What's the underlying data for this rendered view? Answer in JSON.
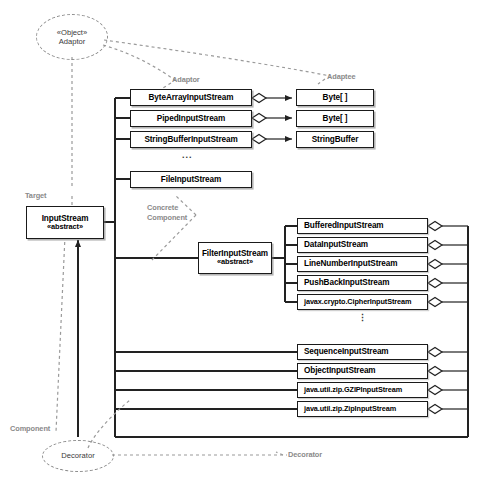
{
  "diagram": {
    "pattern_labels": {
      "object_adaptor_line1": "«Object»",
      "object_adaptor_line2": "Adaptor",
      "decorator_ellipse": "Decorator",
      "adaptor": "Adaptor",
      "adaptee": "Adaptee",
      "target": "Target",
      "component": "Component",
      "decorator_right": "Decorator",
      "concrete_component_line1": "Concrete",
      "concrete_component_line2": "Component"
    },
    "ellipsis_horizontal": "...",
    "ellipsis_vertical": "⋮",
    "colors": {
      "box_border": "#1a1a1a",
      "box_fill": "#ffffff",
      "line": "#222222",
      "dashed_annotation": "#9a9a9a",
      "label_text": "#8a8a8a"
    },
    "target_class": {
      "name": "InputStream",
      "stereotype": "«abstract»"
    },
    "decorator_class": {
      "name": "FilterInputStream",
      "stereotype": "«abstract»"
    },
    "adaptor_classes": [
      {
        "name": "ByteArrayInputStream",
        "adaptee": "Byte[ ]"
      },
      {
        "name": "PipedInputStream",
        "adaptee": "Byte[ ]"
      },
      {
        "name": "StringBufferInputStream",
        "adaptee": "StringBuffer"
      }
    ],
    "concrete_component_classes": [
      {
        "name": "FileInputStream"
      }
    ],
    "concrete_decorator_classes": [
      {
        "name": "BufferedInputStream"
      },
      {
        "name": "DataInputStream"
      },
      {
        "name": "LineNumberInputStream"
      },
      {
        "name": "PushBackInputStream"
      },
      {
        "name": "javax.crypto.CipherInputStream"
      }
    ],
    "other_aggregating_classes": [
      {
        "name": "SequenceInputStream"
      },
      {
        "name": "ObjectInputStream"
      },
      {
        "name": "java.util.zip.GZIPInputStream"
      },
      {
        "name": "java.util.zip.ZipInputStream"
      }
    ]
  }
}
